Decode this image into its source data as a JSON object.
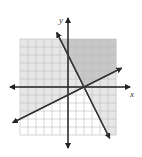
{
  "chart_data": {
    "type": "line",
    "title": "",
    "xlabel": "x",
    "ylabel": "y",
    "xlim": [
      -6,
      6
    ],
    "ylim": [
      -6,
      6
    ],
    "grid": true,
    "series": [
      {
        "name": "boundary-1",
        "equation": "y = -2x + 4",
        "slope": -2,
        "intercept": 4,
        "shade": "right/above"
      },
      {
        "name": "boundary-2",
        "equation": "y = 0.5x - 1",
        "slope": 0.5,
        "intercept": -1,
        "shade": "above"
      }
    ],
    "regions": {
      "overlap_color": "#c8c8c8",
      "single_color": "#e6e6e6",
      "none_color": "#ffffff"
    }
  },
  "labels": {
    "x": "x",
    "y": "y"
  },
  "colors": {
    "grid": "#bdbdbd",
    "axis": "#222222",
    "line": "#333333"
  }
}
